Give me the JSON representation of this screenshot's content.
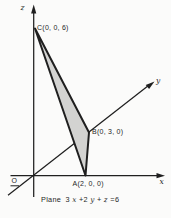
{
  "diagram": {
    "axis_labels": {
      "x": "x",
      "y": "y",
      "z": "z",
      "origin": "O"
    },
    "points": {
      "C": {
        "label": "C(0, 0, 6)",
        "coords": [
          0,
          0,
          6
        ]
      },
      "B": {
        "label": "B(0, 3, 0)",
        "coords": [
          0,
          3,
          0
        ]
      },
      "A": {
        "label": "A(2, 0, 0)",
        "coords": [
          2,
          0,
          0
        ]
      }
    },
    "caption": {
      "parts": [
        {
          "text": "Plane",
          "italic": false
        },
        {
          "text": "3",
          "italic": false
        },
        {
          "text": "x",
          "italic": true
        },
        {
          "text": "+2",
          "italic": false
        },
        {
          "text": "y",
          "italic": true
        },
        {
          "text": "+",
          "italic": false
        },
        {
          "text": "z",
          "italic": true
        },
        {
          "text": "=6",
          "italic": false
        }
      ],
      "plane_equation": "3x+2y+z=6"
    },
    "colors": {
      "ink": "#1f1f1f",
      "plane_fill": "#d3d3d1",
      "background": "#fbfbfa"
    }
  }
}
